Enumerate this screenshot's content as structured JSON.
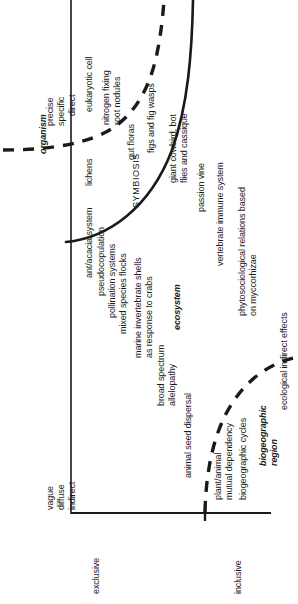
{
  "figure": {
    "orientation": "rotated-90-ccw"
  },
  "axes": {
    "y_axis_top_labels": [
      "precise",
      "specific",
      "direct"
    ],
    "y_axis_bottom_labels": [
      "vague",
      "diffuse",
      "indirect"
    ],
    "x_axis_left_label": "exclusive",
    "x_axis_right_label": "inclusive"
  },
  "levels": {
    "organism": "organism",
    "ecosystem": "ecosystem",
    "biogeographic_region": "biogeographic\nregion"
  },
  "regions": {
    "symbiosis": "SYMBIOSIS"
  },
  "examples": {
    "eukaryotic_cell": "eukaryotic cell",
    "lichens": "lichens",
    "nitrogen_fixing_root_nodules": "nitrogen fixing\nroot nodules",
    "gut_floras": "gut floras",
    "figs_and_fig_wasps": "figs and fig wasps",
    "giant_cowbird": "giant cowbird, bot\nflies and cassique",
    "ant_acacia_system": "ant/acacia system",
    "passion_vine": "passion vine",
    "pseudocopulation": "pseudocopulation",
    "pollination_systems": "pollination systems",
    "mixed_species_flocks": "mixed species flocks",
    "marine_invertebrate_shells": "marine invertebrate shells\nas response to crabs",
    "vertebrate_immune_system": "vertebrate immune system",
    "broad_spectrum_allelopathy": "broad spectrum\nallelopathy",
    "phytosociological_relations": "phytosociological relations based\non myccorhizae",
    "animal_seed_dispersal": "animal seed dispersal",
    "plant_animal_mutual_dependency": "plant/animal\nmutual dependency",
    "biogeographic_cycles": "biogeographic cycles",
    "ecological_indirect_effects": "ecological indirect effects"
  },
  "colors": {
    "line": "#1a1a1a",
    "text": "#1a1a1a",
    "background": "#ffffff"
  }
}
